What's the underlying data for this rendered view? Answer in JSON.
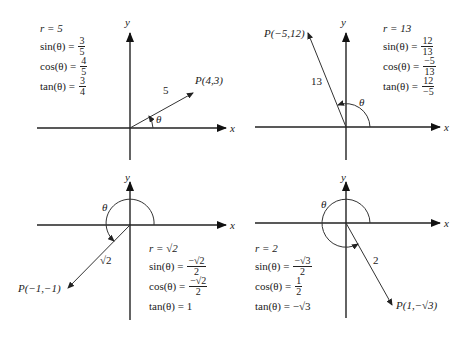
{
  "panels": [
    {
      "id": "q1",
      "point_label": "P(4,3)",
      "radius_label": "5",
      "theta": "θ",
      "x_axis": "x",
      "y_axis": "y",
      "r": "r = 5",
      "sin": {
        "lhs": "sin(θ) =",
        "num": "3",
        "den": "5"
      },
      "cos": {
        "lhs": "cos(θ) =",
        "num": "4",
        "den": "5"
      },
      "tan": {
        "lhs": "tan(θ) =",
        "num": "3",
        "den": "4"
      }
    },
    {
      "id": "q2",
      "point_label": "P(−5,12)",
      "radius_label": "13",
      "theta": "θ",
      "x_axis": "x",
      "y_axis": "y",
      "r": "r = 13",
      "sin": {
        "lhs": "sin(θ) =",
        "num": "12",
        "den": "13"
      },
      "cos": {
        "lhs": "cos(θ) =",
        "num": "−5",
        "den": "13"
      },
      "tan": {
        "lhs": "tan(θ) =",
        "num": "12",
        "den": "−5"
      }
    },
    {
      "id": "q3",
      "point_label": "P(−1,−1)",
      "radius_label": "√2",
      "theta": "θ",
      "x_axis": "x",
      "y_axis": "y",
      "r": "r = √2",
      "sin": {
        "lhs": "sin(θ) =",
        "num": "−√2",
        "den": "2"
      },
      "cos": {
        "lhs": "cos(θ) =",
        "num": "−√2",
        "den": "2"
      },
      "tan": {
        "lhs": "tan(θ) = 1"
      }
    },
    {
      "id": "q4",
      "point_label": "P(1,−√3)",
      "radius_label": "2",
      "theta": "θ",
      "x_axis": "x",
      "y_axis": "y",
      "r": "r = 2",
      "sin": {
        "lhs": "sin(θ) =",
        "num": "−√3",
        "den": "2"
      },
      "cos": {
        "lhs": "cos(θ) =",
        "num": "1",
        "den": "2"
      },
      "tan": {
        "lhs": "tan(θ) = −√3"
      }
    }
  ]
}
